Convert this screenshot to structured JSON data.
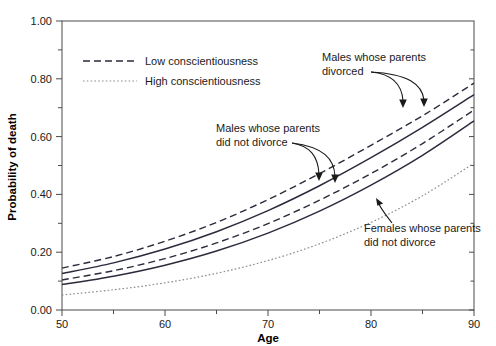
{
  "chart_data": {
    "type": "line",
    "title": "",
    "xlabel": "Age",
    "ylabel": "Probability of death",
    "xlim": [
      50,
      90
    ],
    "ylim": [
      0.0,
      1.0
    ],
    "xticks": [
      50,
      60,
      70,
      80,
      90
    ],
    "xticklabels": [
      "50",
      "60",
      "70",
      "80",
      "90"
    ],
    "yticks": [
      0.0,
      0.2,
      0.4,
      0.6,
      0.8,
      1.0
    ],
    "yticklabels": [
      "0.00",
      "0.20",
      "0.40",
      "0.60",
      "0.80",
      "1.00"
    ],
    "minor_yticks": [
      0.1,
      0.3,
      0.5,
      0.7,
      0.9
    ],
    "grid": false,
    "legend_position": "upper-left",
    "x": [
      50,
      55,
      60,
      65,
      70,
      75,
      80,
      85,
      90
    ],
    "series": [
      {
        "name": "Males whose parents divorced, low conscientiousness",
        "style": "dashed",
        "color": "#2b2b3c",
        "values": [
          0.145,
          0.185,
          0.238,
          0.303,
          0.382,
          0.472,
          0.57,
          0.672,
          0.785
        ]
      },
      {
        "name": "Males whose parents divorced, high conscientiousness",
        "style": "solid",
        "color": "#2b2b3c",
        "values": [
          0.126,
          0.163,
          0.211,
          0.271,
          0.344,
          0.43,
          0.527,
          0.632,
          0.745
        ]
      },
      {
        "name": "Males whose parents did not divorce, low conscientiousness",
        "style": "dashed",
        "color": "#2b2b3c",
        "values": [
          0.104,
          0.136,
          0.178,
          0.232,
          0.299,
          0.38,
          0.472,
          0.576,
          0.692
        ]
      },
      {
        "name": "Males whose parents did not divorce, high conscientiousness",
        "style": "solid",
        "color": "#2b2b3c",
        "values": [
          0.088,
          0.117,
          0.155,
          0.204,
          0.266,
          0.342,
          0.432,
          0.535,
          0.654
        ]
      },
      {
        "name": "Females whose parents did not divorce",
        "style": "dotted",
        "color": "#8a8a96",
        "values": [
          0.052,
          0.07,
          0.094,
          0.127,
          0.171,
          0.229,
          0.303,
          0.395,
          0.508
        ]
      }
    ],
    "legend": [
      {
        "label": "Low conscientiousness",
        "style": "dashed"
      },
      {
        "label": "High conscientiousness",
        "style": "dotted"
      }
    ],
    "annotations": [
      {
        "id": "males-divorced",
        "lines": [
          "Males whose parents",
          "divorced"
        ],
        "points_to": "Males whose parents divorced curves"
      },
      {
        "id": "males-not-divorced",
        "lines": [
          "Males whose parents",
          "did not divorce"
        ],
        "points_to": "Males whose parents did not divorce curves"
      },
      {
        "id": "females-not-divorced",
        "lines": [
          "Females whose parents",
          "did not divorce"
        ],
        "points_to": "Females whose parents did not divorce curve"
      }
    ]
  },
  "axes": {
    "x_title": "Age",
    "y_title": "Probability of death"
  }
}
